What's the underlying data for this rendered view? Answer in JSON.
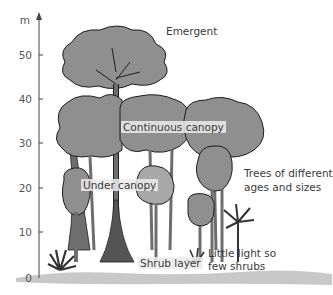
{
  "diagram": {
    "axis": {
      "unit": "m",
      "ticks": [
        "0",
        "10",
        "20",
        "30",
        "40",
        "50"
      ]
    },
    "labels": {
      "emergent": "Emergent",
      "continuous_canopy": "Continuous canopy",
      "under_canopy": "Under canopy",
      "trees_line1": "Trees of different",
      "trees_line2": "ages and sizes",
      "shrub_layer": "Shrub layer",
      "little_light_line1": "Little light so",
      "little_light_line2": "few shrubs"
    },
    "colors": {
      "foliage": "#8f8f8f",
      "foliage_light": "#a8a8a8",
      "outline": "#1e1e1e",
      "trunk": "#6e6e6e",
      "ground": "#c8c8c8",
      "text": "#3a3a3a"
    }
  }
}
